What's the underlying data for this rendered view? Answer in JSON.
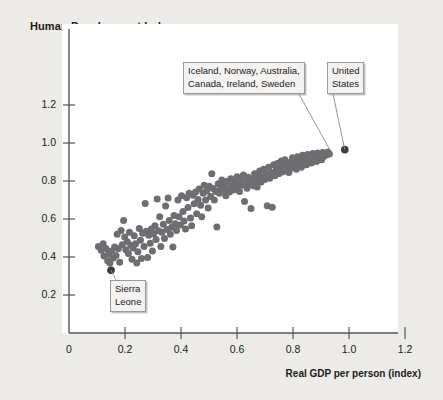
{
  "chart_data": {
    "type": "scatter",
    "title": "Human Development Index",
    "xlabel": "Real GDP per person (index)",
    "ylabel": "Human Development Index",
    "xlim": [
      0,
      1.32
    ],
    "ylim": [
      0,
      1.3
    ],
    "xticks": [
      "0",
      "0.2",
      "0.4",
      "0.6",
      "0.8",
      "1.0",
      "1.2"
    ],
    "xtick_values": [
      0,
      0.2,
      0.4,
      0.6,
      0.8,
      1.0,
      1.2
    ],
    "yticks": [
      "0.2",
      "0.4",
      "0.6",
      "0.8",
      "1.0",
      "1.2"
    ],
    "ytick_values": [
      0.2,
      0.4,
      0.6,
      0.8,
      1.0,
      1.2
    ],
    "grid": false,
    "legend": "none",
    "point_color": "#6e6e72",
    "highlight_color": "#3c3c40",
    "marker_size": 7,
    "series": [
      {
        "name": "Countries",
        "points": [
          [
            0.105,
            0.455
          ],
          [
            0.115,
            0.435
          ],
          [
            0.122,
            0.47
          ],
          [
            0.125,
            0.405
          ],
          [
            0.132,
            0.445
          ],
          [
            0.138,
            0.38
          ],
          [
            0.141,
            0.415
          ],
          [
            0.146,
            0.368
          ],
          [
            0.15,
            0.33
          ],
          [
            0.152,
            0.432
          ],
          [
            0.158,
            0.395
          ],
          [
            0.163,
            0.452
          ],
          [
            0.168,
            0.408
          ],
          [
            0.172,
            0.52
          ],
          [
            0.176,
            0.443
          ],
          [
            0.181,
            0.372
          ],
          [
            0.186,
            0.54
          ],
          [
            0.19,
            0.465
          ],
          [
            0.195,
            0.592
          ],
          [
            0.199,
            0.505
          ],
          [
            0.203,
            0.438
          ],
          [
            0.208,
            0.48
          ],
          [
            0.212,
            0.418
          ],
          [
            0.216,
            0.53
          ],
          [
            0.221,
            0.462
          ],
          [
            0.225,
            0.388
          ],
          [
            0.229,
            0.447
          ],
          [
            0.233,
            0.512
          ],
          [
            0.238,
            0.47
          ],
          [
            0.242,
            0.368
          ],
          [
            0.246,
            0.428
          ],
          [
            0.251,
            0.55
          ],
          [
            0.255,
            0.488
          ],
          [
            0.259,
            0.392
          ],
          [
            0.263,
            0.525
          ],
          [
            0.268,
            0.455
          ],
          [
            0.272,
            0.682
          ],
          [
            0.276,
            0.536
          ],
          [
            0.281,
            0.398
          ],
          [
            0.285,
            0.515
          ],
          [
            0.29,
            0.472
          ],
          [
            0.294,
            0.548
          ],
          [
            0.298,
            0.432
          ],
          [
            0.302,
            0.522
          ],
          [
            0.307,
            0.565
          ],
          [
            0.311,
            0.492
          ],
          [
            0.315,
            0.705
          ],
          [
            0.32,
            0.538
          ],
          [
            0.324,
            0.612
          ],
          [
            0.328,
            0.455
          ],
          [
            0.332,
            0.53
          ],
          [
            0.337,
            0.572
          ],
          [
            0.341,
            0.498
          ],
          [
            0.345,
            0.668
          ],
          [
            0.35,
            0.545
          ],
          [
            0.354,
            0.71
          ],
          [
            0.358,
            0.592
          ],
          [
            0.362,
            0.52
          ],
          [
            0.367,
            0.556
          ],
          [
            0.371,
            0.452
          ],
          [
            0.375,
            0.618
          ],
          [
            0.38,
            0.575
          ],
          [
            0.384,
            0.54
          ],
          [
            0.389,
            0.7
          ],
          [
            0.393,
            0.612
          ],
          [
            0.398,
            0.568
          ],
          [
            0.402,
            0.722
          ],
          [
            0.407,
            0.64
          ],
          [
            0.411,
            0.59
          ],
          [
            0.416,
            0.548
          ],
          [
            0.42,
            0.712
          ],
          [
            0.425,
            0.66
          ],
          [
            0.429,
            0.735
          ],
          [
            0.434,
            0.605
          ],
          [
            0.438,
            0.565
          ],
          [
            0.443,
            0.725
          ],
          [
            0.447,
            0.68
          ],
          [
            0.452,
            0.742
          ],
          [
            0.456,
            0.628
          ],
          [
            0.461,
            0.702
          ],
          [
            0.465,
            0.758
          ],
          [
            0.47,
            0.672
          ],
          [
            0.474,
            0.612
          ],
          [
            0.479,
            0.735
          ],
          [
            0.483,
            0.778
          ],
          [
            0.488,
            0.7
          ],
          [
            0.492,
            0.748
          ],
          [
            0.497,
            0.658
          ],
          [
            0.501,
            0.772
          ],
          [
            0.506,
            0.718
          ],
          [
            0.51,
            0.838
          ],
          [
            0.515,
            0.76
          ],
          [
            0.519,
            0.7
          ],
          [
            0.524,
            0.745
          ],
          [
            0.528,
            0.558
          ],
          [
            0.533,
            0.785
          ],
          [
            0.537,
            0.735
          ],
          [
            0.542,
            0.762
          ],
          [
            0.546,
            0.805
          ],
          [
            0.551,
            0.748
          ],
          [
            0.555,
            0.782
          ],
          [
            0.56,
            0.722
          ],
          [
            0.564,
            0.798
          ],
          [
            0.569,
            0.76
          ],
          [
            0.573,
            0.742
          ],
          [
            0.578,
            0.812
          ],
          [
            0.582,
            0.775
          ],
          [
            0.587,
            0.752
          ],
          [
            0.591,
            0.8
          ],
          [
            0.596,
            0.765
          ],
          [
            0.6,
            0.822
          ],
          [
            0.605,
            0.785
          ],
          [
            0.609,
            0.745
          ],
          [
            0.614,
            0.812
          ],
          [
            0.618,
            0.778
          ],
          [
            0.623,
            0.832
          ],
          [
            0.627,
            0.692
          ],
          [
            0.632,
            0.796
          ],
          [
            0.636,
            0.762
          ],
          [
            0.641,
            0.82
          ],
          [
            0.645,
            0.788
          ],
          [
            0.65,
            0.655
          ],
          [
            0.654,
            0.808
          ],
          [
            0.659,
            0.775
          ],
          [
            0.663,
            0.838
          ],
          [
            0.668,
            0.8
          ],
          [
            0.672,
            0.768
          ],
          [
            0.677,
            0.825
          ],
          [
            0.681,
            0.852
          ],
          [
            0.686,
            0.795
          ],
          [
            0.69,
            0.82
          ],
          [
            0.695,
            0.862
          ],
          [
            0.699,
            0.808
          ],
          [
            0.704,
            0.838
          ],
          [
            0.708,
            0.67
          ],
          [
            0.713,
            0.872
          ],
          [
            0.717,
            0.815
          ],
          [
            0.722,
            0.845
          ],
          [
            0.726,
            0.662
          ],
          [
            0.731,
            0.885
          ],
          [
            0.735,
            0.828
          ],
          [
            0.74,
            0.858
          ],
          [
            0.744,
            0.892
          ],
          [
            0.749,
            0.838
          ],
          [
            0.753,
            0.866
          ],
          [
            0.758,
            0.905
          ],
          [
            0.762,
            0.848
          ],
          [
            0.767,
            0.878
          ],
          [
            0.771,
            0.912
          ],
          [
            0.776,
            0.858
          ],
          [
            0.78,
            0.885
          ],
          [
            0.785,
            0.845
          ],
          [
            0.789,
            0.898
          ],
          [
            0.794,
            0.868
          ],
          [
            0.798,
            0.922
          ],
          [
            0.803,
            0.88
          ],
          [
            0.807,
            0.905
          ],
          [
            0.812,
            0.862
          ],
          [
            0.816,
            0.928
          ],
          [
            0.821,
            0.892
          ],
          [
            0.825,
            0.918
          ],
          [
            0.83,
            0.872
          ],
          [
            0.834,
            0.935
          ],
          [
            0.839,
            0.9
          ],
          [
            0.843,
            0.925
          ],
          [
            0.848,
            0.885
          ],
          [
            0.852,
            0.94
          ],
          [
            0.857,
            0.908
          ],
          [
            0.861,
            0.932
          ],
          [
            0.866,
            0.895
          ],
          [
            0.87,
            0.945
          ],
          [
            0.875,
            0.915
          ],
          [
            0.879,
            0.938
          ],
          [
            0.884,
            0.902
          ],
          [
            0.888,
            0.948
          ],
          [
            0.893,
            0.922
          ],
          [
            0.897,
            0.942
          ],
          [
            0.902,
            0.912
          ],
          [
            0.906,
            0.95
          ],
          [
            0.911,
            0.93
          ],
          [
            0.915,
            0.946
          ],
          [
            0.92,
            0.938
          ],
          [
            0.925,
            0.952
          ],
          [
            0.93,
            0.942
          ]
        ]
      }
    ],
    "highlight_points": [
      {
        "label": "Sierra Leone",
        "x": 0.15,
        "y": 0.33
      },
      {
        "label": "United States",
        "x": 0.985,
        "y": 0.965
      }
    ],
    "annotations": [
      {
        "name": "top-countries",
        "text": "Iceland, Norway, Australia,\nCanada, Ireland, Sweden",
        "target_x": 0.935,
        "target_y": 0.955
      },
      {
        "name": "united-states",
        "text": "United\nStates",
        "target_x": 0.985,
        "target_y": 0.965
      },
      {
        "name": "sierra-leone",
        "text": "Sierra\nLeone",
        "target_x": 0.15,
        "target_y": 0.33
      }
    ]
  },
  "axes": {
    "x_title": "Real GDP per person (index)",
    "y_title": "Human Development Index"
  }
}
